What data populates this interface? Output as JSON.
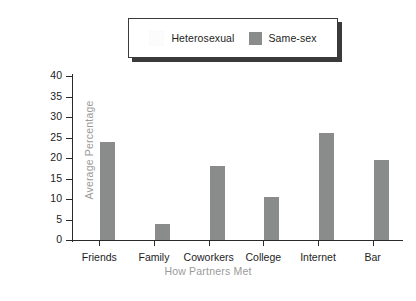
{
  "chart_data": {
    "type": "bar",
    "title": "",
    "xlabel": "How Partners Met",
    "ylabel": "Average Percentage",
    "categories": [
      "Friends",
      "Family",
      "Coworkers",
      "College",
      "Internet",
      "Bar"
    ],
    "series": [
      {
        "name": "Heterosexual",
        "color": "#fcfcfc",
        "values": [
          0,
          0,
          0,
          0,
          0,
          0
        ]
      },
      {
        "name": "Same-sex",
        "color": "#8a8c8c",
        "values": [
          24,
          4,
          18,
          10.5,
          26,
          19.5
        ]
      }
    ],
    "ylim": [
      0,
      40
    ],
    "yticks": [
      0,
      5,
      10,
      15,
      20,
      25,
      30,
      35,
      40
    ],
    "ytick_labels": [
      "0",
      "5",
      "10",
      "15",
      "20",
      "25",
      "30",
      "35",
      "40"
    ],
    "grid": false,
    "legend_position": "top-center"
  },
  "legend": {
    "entries": [
      {
        "label": "Heterosexual",
        "color": "#fcfcfc"
      },
      {
        "label": "Same-sex",
        "color": "#8a8c8c"
      }
    ]
  },
  "axes": {
    "y_title": "Average Percentage",
    "x_title": "How Partners Met"
  },
  "colors": {
    "bar_same_sex": "#8a8c8c",
    "bar_heterosexual": "#fcfcfc",
    "axis": "#2a2a2a",
    "axis_title": "#9a9a9a",
    "tick_text": "#1d1d1d",
    "legend_border": "#3a3a3a",
    "legend_shadow": "#3a3a3a",
    "background": "#ffffff"
  }
}
